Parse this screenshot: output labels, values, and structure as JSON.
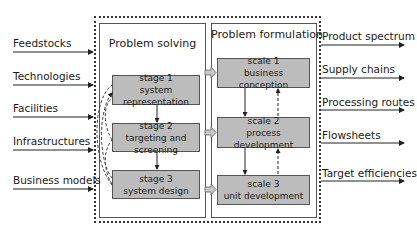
{
  "diagram": {
    "inputs": [
      {
        "label": "Feedstocks"
      },
      {
        "label": "Technologies"
      },
      {
        "label": "Facilities"
      },
      {
        "label": "Infrastructures"
      },
      {
        "label": "Business models"
      }
    ],
    "outputs": [
      {
        "label": "Product spectrum"
      },
      {
        "label": "Supply chains"
      },
      {
        "label": "Processing routes"
      },
      {
        "label": "Flowsheets"
      },
      {
        "label": "Target efficiencies"
      }
    ],
    "problem_solving": {
      "title": "Problem solving",
      "stages": [
        {
          "line1": "stage 1",
          "line2": "system representation"
        },
        {
          "line1": "stage 2",
          "line2": "targeting and screening"
        },
        {
          "line1": "stage 3",
          "line2": "system design"
        }
      ]
    },
    "problem_formulation": {
      "title": "Problem formulation",
      "scales": [
        {
          "line1": "scale 1",
          "line2": "business conception"
        },
        {
          "line1": "scale 2",
          "line2": "process development"
        },
        {
          "line1": "scale 3",
          "line2": "unit development"
        }
      ]
    },
    "colors": {
      "box_fill": "#bcbcbc",
      "line": "#333333",
      "transfer_arrow": "#b0b0b0"
    }
  }
}
